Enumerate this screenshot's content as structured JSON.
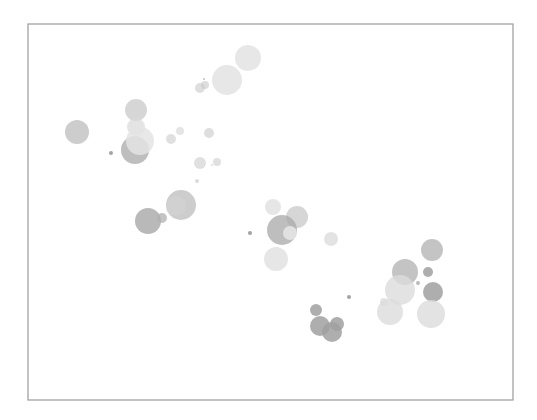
{
  "chart_data": {
    "type": "scatter",
    "subtype": "bubble",
    "title": "",
    "xlabel": "",
    "ylabel": "",
    "grid": false,
    "legend": null,
    "axes_visible": false,
    "frame": {
      "x0": 28,
      "y0": 24,
      "x1": 513,
      "y1": 400,
      "color": "#9a9a9a"
    },
    "points": [
      {
        "x": 248,
        "y": 58,
        "r": 13,
        "color": "#d4d4d4",
        "alpha": 0.55
      },
      {
        "x": 227,
        "y": 80,
        "r": 15,
        "color": "#d4d4d4",
        "alpha": 0.55
      },
      {
        "x": 200,
        "y": 88,
        "r": 5,
        "color": "#c8c8c8",
        "alpha": 0.6
      },
      {
        "x": 205,
        "y": 85,
        "r": 4,
        "color": "#c8c8c8",
        "alpha": 0.6
      },
      {
        "x": 204,
        "y": 79,
        "r": 1,
        "color": "#b0b0b0",
        "alpha": 0.8
      },
      {
        "x": 77,
        "y": 132,
        "r": 12,
        "color": "#b8b8b8",
        "alpha": 0.7
      },
      {
        "x": 136,
        "y": 110,
        "r": 11,
        "color": "#c0c0c0",
        "alpha": 0.65
      },
      {
        "x": 135,
        "y": 150,
        "r": 14,
        "color": "#a8a8a8",
        "alpha": 0.75
      },
      {
        "x": 136,
        "y": 127,
        "r": 9,
        "color": "#d8d8d8",
        "alpha": 0.7
      },
      {
        "x": 140,
        "y": 141,
        "r": 14,
        "color": "#e4e4e4",
        "alpha": 0.85
      },
      {
        "x": 111,
        "y": 153,
        "r": 2,
        "color": "#999999",
        "alpha": 0.9
      },
      {
        "x": 171,
        "y": 139,
        "r": 5,
        "color": "#cccccc",
        "alpha": 0.6
      },
      {
        "x": 180,
        "y": 131,
        "r": 4,
        "color": "#d4d4d4",
        "alpha": 0.6
      },
      {
        "x": 209,
        "y": 133,
        "r": 5,
        "color": "#c8c8c8",
        "alpha": 0.6
      },
      {
        "x": 200,
        "y": 163,
        "r": 6,
        "color": "#cccccc",
        "alpha": 0.6
      },
      {
        "x": 217,
        "y": 162,
        "r": 4,
        "color": "#cccccc",
        "alpha": 0.6
      },
      {
        "x": 212,
        "y": 165,
        "r": 1,
        "color": "#cccccc",
        "alpha": 0.7
      },
      {
        "x": 197,
        "y": 181,
        "r": 2,
        "color": "#cccccc",
        "alpha": 0.7
      },
      {
        "x": 148,
        "y": 221,
        "r": 13,
        "color": "#a8a8a8",
        "alpha": 0.8
      },
      {
        "x": 162,
        "y": 218,
        "r": 5,
        "color": "#b0b0b0",
        "alpha": 0.75
      },
      {
        "x": 181,
        "y": 205,
        "r": 15,
        "color": "#b8b8b8",
        "alpha": 0.7
      },
      {
        "x": 176,
        "y": 206,
        "r": 10,
        "color": "#d4d4d4",
        "alpha": 0.6
      },
      {
        "x": 250,
        "y": 233,
        "r": 2,
        "color": "#999999",
        "alpha": 0.9
      },
      {
        "x": 273,
        "y": 207,
        "r": 8,
        "color": "#d8d8d8",
        "alpha": 0.65
      },
      {
        "x": 297,
        "y": 217,
        "r": 11,
        "color": "#c0c0c0",
        "alpha": 0.65
      },
      {
        "x": 282,
        "y": 230,
        "r": 15,
        "color": "#a8a8a8",
        "alpha": 0.75
      },
      {
        "x": 290,
        "y": 233,
        "r": 7,
        "color": "#e4e4e4",
        "alpha": 0.9
      },
      {
        "x": 276,
        "y": 259,
        "r": 12,
        "color": "#d8d8d8",
        "alpha": 0.65
      },
      {
        "x": 331,
        "y": 239,
        "r": 7,
        "color": "#d4d4d4",
        "alpha": 0.65
      },
      {
        "x": 316,
        "y": 310,
        "r": 6,
        "color": "#a0a0a0",
        "alpha": 0.85
      },
      {
        "x": 320,
        "y": 326,
        "r": 10,
        "color": "#a0a0a0",
        "alpha": 0.85
      },
      {
        "x": 332,
        "y": 332,
        "r": 10,
        "color": "#a0a0a0",
        "alpha": 0.85
      },
      {
        "x": 337,
        "y": 324,
        "r": 7,
        "color": "#a0a0a0",
        "alpha": 0.85
      },
      {
        "x": 349,
        "y": 297,
        "r": 2,
        "color": "#999999",
        "alpha": 0.9
      },
      {
        "x": 432,
        "y": 250,
        "r": 11,
        "color": "#b0b0b0",
        "alpha": 0.75
      },
      {
        "x": 405,
        "y": 272,
        "r": 13,
        "color": "#b0b0b0",
        "alpha": 0.75
      },
      {
        "x": 428,
        "y": 272,
        "r": 5,
        "color": "#a0a0a0",
        "alpha": 0.85
      },
      {
        "x": 400,
        "y": 290,
        "r": 15,
        "color": "#dcdcdc",
        "alpha": 0.8
      },
      {
        "x": 433,
        "y": 292,
        "r": 10,
        "color": "#a0a0a0",
        "alpha": 0.85
      },
      {
        "x": 418,
        "y": 283,
        "r": 2,
        "color": "#aaaaaa",
        "alpha": 0.8
      },
      {
        "x": 384,
        "y": 302,
        "r": 4,
        "color": "#dcdcdc",
        "alpha": 0.8
      },
      {
        "x": 390,
        "y": 312,
        "r": 13,
        "color": "#dcdcdc",
        "alpha": 0.8
      },
      {
        "x": 431,
        "y": 314,
        "r": 14,
        "color": "#dcdcdc",
        "alpha": 0.8
      }
    ]
  }
}
